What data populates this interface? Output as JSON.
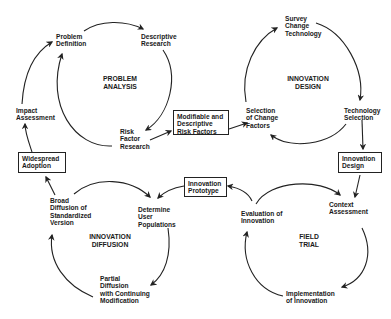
{
  "cycles": [
    {
      "id": "problem-analysis",
      "title": [
        "PROBLEM",
        "ANALYSIS"
      ],
      "nodes": [
        [
          "Problem",
          "Definition"
        ],
        [
          "Descriptive",
          "Research"
        ],
        [
          "Risk",
          "Factor",
          "Research"
        ]
      ]
    },
    {
      "id": "innovation-design",
      "title": [
        "INNOVATION",
        "DESIGN"
      ],
      "nodes": [
        [
          "Survey",
          "Change",
          "Technology"
        ],
        [
          "Technology",
          "Selection"
        ],
        [
          "Selection",
          "of Change",
          "Factors"
        ]
      ]
    },
    {
      "id": "field-trial",
      "title": [
        "FIELD",
        "TRIAL"
      ],
      "nodes": [
        [
          "Context",
          "Assessment"
        ],
        [
          "Implementation",
          "of Innovation"
        ],
        [
          "Evaluation of",
          "Innovation"
        ]
      ]
    },
    {
      "id": "innovation-diffusion",
      "title": [
        "INNOVATION",
        "DIFFUSION"
      ],
      "nodes": [
        [
          "Determine",
          "User",
          "Populations"
        ],
        [
          "Partial",
          "Diffusion",
          "with Continuing",
          "Modification"
        ],
        [
          "Broad",
          "Diffusion of",
          "Standardized",
          "Version"
        ]
      ]
    }
  ],
  "boxes": {
    "risk_factors": [
      "Modifiable and",
      "Descriptive",
      "Risk Factors"
    ],
    "innovation_design": [
      "Innovation",
      "Design"
    ],
    "innovation_prototype": [
      "Innovation",
      "Prototype"
    ],
    "widespread_adoption": [
      "Widespread",
      "Adoption"
    ]
  },
  "outer_labels": {
    "impact_assessment": [
      "Impact",
      "Assessment"
    ]
  },
  "colors": {
    "line": "#222222",
    "background": "#ffffff"
  }
}
